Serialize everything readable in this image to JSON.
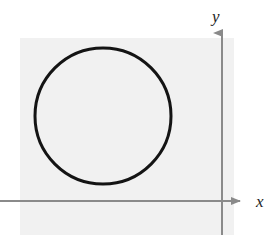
{
  "figure": {
    "background_color": "#ffffff",
    "panel": {
      "name": "plot-panel",
      "fill_color": "#f1f1f1",
      "x": 20,
      "y": 38,
      "width": 214,
      "height": 197
    },
    "axes": {
      "color": "#8a8a8a",
      "stroke_width": 2,
      "x_axis": {
        "label": "x",
        "y_position": 201,
        "x_start": 0,
        "x_end": 243,
        "arrow": "right-arrow-icon",
        "label_x": 258,
        "label_y": 201
      },
      "y_axis": {
        "label": "y",
        "x_position": 222,
        "y_start": 235,
        "y_end": 30,
        "arrow": "up-arrow-icon",
        "label_x": 215,
        "label_y": 18
      }
    },
    "curve": {
      "name": "circle-curve",
      "shape": "circle",
      "stroke_color": "#141414",
      "stroke_width": 3,
      "fill": "none",
      "center_x": 103,
      "center_y": 116,
      "radius": 68
    }
  },
  "chart_data": {
    "type": "scatter",
    "xlabel": "x",
    "ylabel": "y",
    "grid": false,
    "legend": null,
    "annotations": [],
    "xticks": [],
    "yticks": [],
    "series": [
      {
        "name": "circle",
        "shape": "circle",
        "center_px": [
          103,
          116
        ],
        "radius_px": 68,
        "stroke": "#141414",
        "fill": "none"
      }
    ],
    "axis_origin_px": [
      222,
      201
    ],
    "note": "Unlabeled circle lying entirely in the second quadrant (left of the y-axis, above the x-axis); no tick marks or numeric scale shown."
  }
}
